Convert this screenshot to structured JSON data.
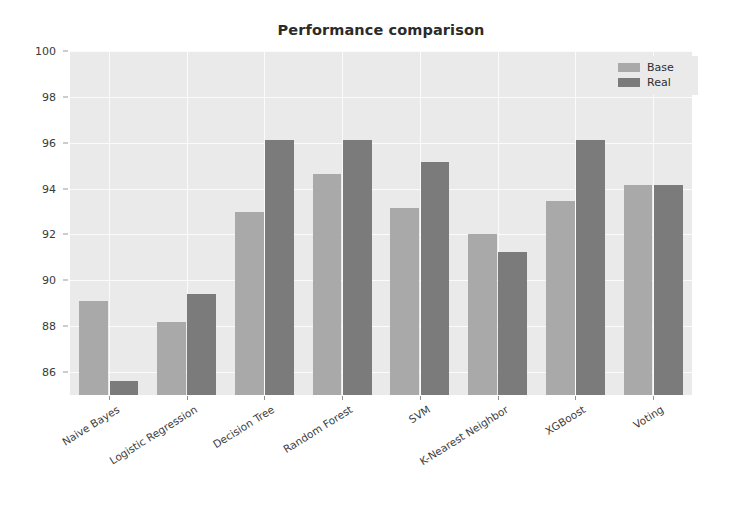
{
  "chart_data": {
    "type": "bar",
    "title": "Performance comparison",
    "xlabel": "",
    "ylabel": "",
    "ylim": [
      85,
      100
    ],
    "yticks": [
      86,
      88,
      90,
      92,
      94,
      96,
      98,
      100
    ],
    "grid": true,
    "legend_position": "upper right",
    "categories": [
      "Naive Bayes",
      "Logistic Regression",
      "Decision Tree",
      "Random Forest",
      "SVM",
      "K-Nearest Neighbor",
      "XGBoost",
      "Voting"
    ],
    "series": [
      {
        "name": "Base",
        "color": "#a9a9a9",
        "values": [
          89.1,
          88.2,
          93.0,
          94.65,
          93.15,
          92.0,
          93.45,
          94.15
        ]
      },
      {
        "name": "Real",
        "color": "#7b7b7b",
        "values": [
          85.6,
          89.4,
          96.1,
          96.1,
          95.15,
          91.25,
          96.1,
          94.15
        ]
      }
    ]
  },
  "figure": {
    "background": "#ffffff",
    "axes_background": "#eaeaea",
    "gridline_color": "#fbfbfb"
  }
}
